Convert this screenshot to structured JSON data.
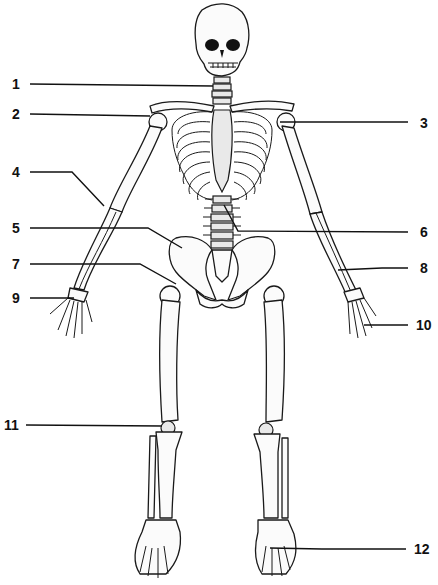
{
  "diagram": {
    "labels": [
      {
        "id": 1,
        "text": "1",
        "side": "left",
        "x": 12,
        "y": 79
      },
      {
        "id": 2,
        "text": "2",
        "side": "left",
        "x": 12,
        "y": 108
      },
      {
        "id": 3,
        "text": "3",
        "side": "right",
        "x": 422,
        "y": 118
      },
      {
        "id": 4,
        "text": "4",
        "side": "left",
        "x": 12,
        "y": 166
      },
      {
        "id": 5,
        "text": "5",
        "side": "left",
        "x": 12,
        "y": 222
      },
      {
        "id": 6,
        "text": "6",
        "side": "right",
        "x": 422,
        "y": 227
      },
      {
        "id": 7,
        "text": "7",
        "side": "left",
        "x": 12,
        "y": 258
      },
      {
        "id": 8,
        "text": "8",
        "side": "right",
        "x": 422,
        "y": 262
      },
      {
        "id": 9,
        "text": "9",
        "side": "left",
        "x": 12,
        "y": 292
      },
      {
        "id": 10,
        "text": "10",
        "side": "right",
        "x": 418,
        "y": 318
      },
      {
        "id": 11,
        "text": "11",
        "side": "left",
        "x": 6,
        "y": 419
      },
      {
        "id": 12,
        "text": "12",
        "side": "right",
        "x": 416,
        "y": 543
      }
    ]
  }
}
